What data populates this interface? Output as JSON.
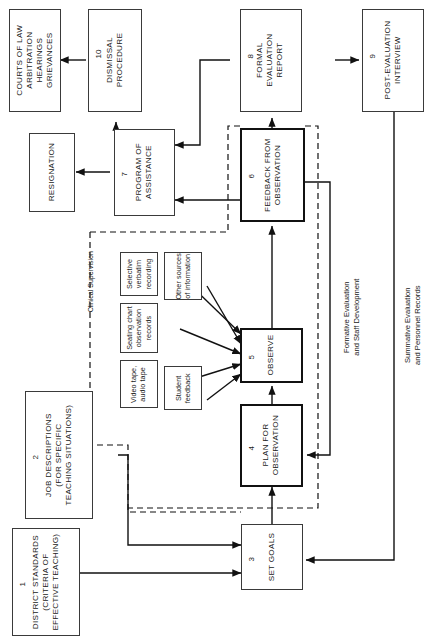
{
  "diagram": {
    "orientation": "rotated-90-ccw",
    "group_label": "Clinical Supervision",
    "flow_labels": {
      "formative": "Formative Evaluation\nand Staff Development",
      "formative_line1": "Formative Evaluation",
      "formative_line2": "and Staff Development",
      "summative_line1": "Summative Evaluation",
      "summative_line2": "and Personnel Records"
    },
    "nodes": [
      {
        "id": "district-standards",
        "number": "1",
        "lines": [
          "DISTRICT STANDARDS",
          "(CRITERIA OF",
          "EFFECTIVE TEACHING)"
        ]
      },
      {
        "id": "job-descriptions",
        "number": "2",
        "lines": [
          "JOB DESCRIPTIONS",
          "(FOR SPECIFIC",
          "TEACHING SITUATIONS)"
        ]
      },
      {
        "id": "set-goals",
        "number": "3",
        "lines": [
          "SET GOALS"
        ]
      },
      {
        "id": "plan-for-observation",
        "number": "4",
        "lines": [
          "PLAN FOR",
          "OBSERVATION"
        ]
      },
      {
        "id": "observe",
        "number": "5",
        "lines": [
          "OBSERVE"
        ]
      },
      {
        "id": "feedback-from-observation",
        "number": "6",
        "lines": [
          "FEEDBACK FROM",
          "OBSERVATION"
        ]
      },
      {
        "id": "program-of-assistance",
        "number": "7",
        "lines": [
          "PROGRAM OF",
          "ASSISTANCE"
        ]
      },
      {
        "id": "formal-evaluation-report",
        "number": "8",
        "lines": [
          "FORMAL",
          "EVALUATION",
          "REPORT"
        ]
      },
      {
        "id": "post-evaluation-interview",
        "number": "9",
        "lines": [
          "POST-EVALUATION",
          "INTERVIEW"
        ]
      },
      {
        "id": "dismissal-procedure",
        "number": "10",
        "lines": [
          "DISMISSAL",
          "PROCEDURE"
        ]
      },
      {
        "id": "resignation",
        "number": "",
        "lines": [
          "RESIGNATION"
        ]
      },
      {
        "id": "courts-of-law",
        "number": "",
        "lines": [
          "COURTS OF LAW",
          "ARBITRATION",
          "HEARINGS",
          "GRIEVANCES"
        ]
      }
    ],
    "sources": [
      {
        "id": "selective-verbatim-recording",
        "lines": [
          "Selective",
          "verbatim",
          "recording"
        ]
      },
      {
        "id": "other-sources-of-information",
        "lines": [
          "Other sources",
          "of information"
        ]
      },
      {
        "id": "seating-chart-observation-records",
        "lines": [
          "Seating chart",
          "observation",
          "records"
        ]
      },
      {
        "id": "video-tape-audio-tape",
        "lines": [
          "Video tape,",
          "audio tape"
        ]
      },
      {
        "id": "student-feedback",
        "lines": [
          "Student",
          "feedback"
        ]
      }
    ]
  }
}
